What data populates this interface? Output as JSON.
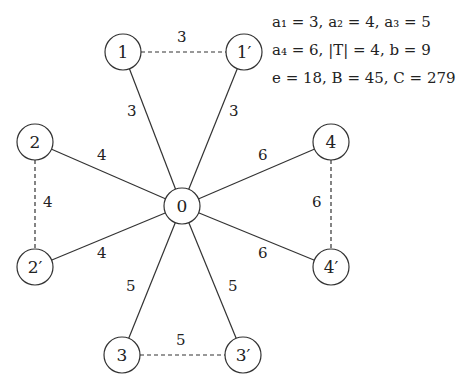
{
  "diagram": {
    "type": "weighted-star-graph",
    "nodes": [
      {
        "id": "0",
        "label": "0",
        "x": 182,
        "y": 206
      },
      {
        "id": "1",
        "label": "1",
        "x": 123,
        "y": 52
      },
      {
        "id": "1p",
        "label": "1′",
        "x": 244,
        "y": 52
      },
      {
        "id": "2",
        "label": "2",
        "x": 35,
        "y": 142
      },
      {
        "id": "2p",
        "label": "2′",
        "x": 35,
        "y": 267
      },
      {
        "id": "4",
        "label": "4",
        "x": 331,
        "y": 142
      },
      {
        "id": "4p",
        "label": "4′",
        "x": 331,
        "y": 267
      },
      {
        "id": "3",
        "label": "3",
        "x": 122,
        "y": 355
      },
      {
        "id": "3p",
        "label": "3′",
        "x": 243,
        "y": 355
      }
    ],
    "edges": [
      {
        "from": "0",
        "to": "1",
        "weight": "3",
        "style": "solid"
      },
      {
        "from": "0",
        "to": "1p",
        "weight": "3",
        "style": "solid"
      },
      {
        "from": "1",
        "to": "1p",
        "weight": "3",
        "style": "dashed"
      },
      {
        "from": "0",
        "to": "2",
        "weight": "4",
        "style": "solid"
      },
      {
        "from": "0",
        "to": "2p",
        "weight": "4",
        "style": "solid"
      },
      {
        "from": "2",
        "to": "2p",
        "weight": "4",
        "style": "dashed"
      },
      {
        "from": "0",
        "to": "4",
        "weight": "6",
        "style": "solid"
      },
      {
        "from": "0",
        "to": "4p",
        "weight": "6",
        "style": "solid"
      },
      {
        "from": "4",
        "to": "4p",
        "weight": "6",
        "style": "dashed"
      },
      {
        "from": "0",
        "to": "3",
        "weight": "5",
        "style": "solid"
      },
      {
        "from": "0",
        "to": "3p",
        "weight": "5",
        "style": "solid"
      },
      {
        "from": "3",
        "to": "3p",
        "weight": "5",
        "style": "dashed"
      }
    ]
  },
  "params": {
    "line1": "a₁ = 3,  a₂ = 4,  a₃ = 5",
    "line2": "a₄ = 6,  |T| = 4,  b = 9",
    "line3": "e = 18,  B = 45,  C = 279"
  }
}
